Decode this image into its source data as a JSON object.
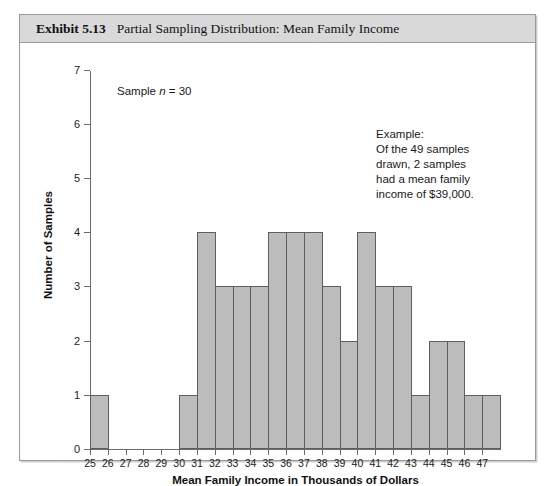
{
  "banner": {
    "exhibit_number": "Exhibit 5.13",
    "title": "Partial Sampling Distribution: Mean Family Income"
  },
  "annotations": {
    "sample_note_prefix": "Sample ",
    "sample_note_var": "n",
    "sample_note_suffix": " = 30",
    "example_lines": [
      "Example:",
      "Of the 49 samples",
      "drawn, 2 samples",
      "had a mean family",
      "income of $39,000."
    ]
  },
  "colors": {
    "bar_fill": "#bcbcbc",
    "bar_stroke": "#5e5e5e",
    "banner_bg": "#d9d9d9",
    "frame_border": "#9a9a9a",
    "axis": "#6b6b6b"
  },
  "chart_data": {
    "type": "bar",
    "title": "Partial Sampling Distribution: Mean Family Income",
    "xlabel": "Mean Family Income in Thousands of Dollars",
    "ylabel": "Number of Samples",
    "categories": [
      25,
      26,
      27,
      28,
      29,
      30,
      31,
      32,
      33,
      34,
      35,
      36,
      37,
      38,
      39,
      40,
      41,
      42,
      43,
      44,
      45,
      46,
      47
    ],
    "values": [
      1,
      0,
      0,
      0,
      0,
      1,
      4,
      3,
      3,
      3,
      4,
      4,
      4,
      3,
      2,
      4,
      3,
      3,
      1,
      2,
      2,
      1,
      1
    ],
    "xticks": [
      25,
      26,
      27,
      28,
      29,
      30,
      31,
      32,
      33,
      34,
      35,
      36,
      37,
      38,
      39,
      40,
      41,
      42,
      43,
      44,
      45,
      46,
      47
    ],
    "yticks": [
      0,
      1,
      2,
      3,
      4,
      5,
      6,
      7
    ],
    "ylim": [
      0,
      7
    ],
    "xlim": [
      25,
      48
    ],
    "grid": false,
    "legend": "none",
    "bar_align": "edge",
    "sample_size": 30,
    "total_samples": 49
  }
}
